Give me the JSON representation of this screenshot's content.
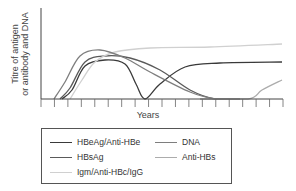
{
  "chart_data": {
    "type": "line",
    "title": "",
    "xlabel": "Years",
    "ylabel": "Titre of antigen or antibody and DNA",
    "x_ticks": 18,
    "grid": false,
    "legend_position": "bottom-box",
    "series": [
      {
        "name": "HBeAg/Anti-HBe",
        "color": "#3a3a3a",
        "points": [
          [
            62,
            99
          ],
          [
            72,
            90
          ],
          [
            85,
            66
          ],
          [
            105,
            60
          ],
          [
            125,
            64
          ],
          [
            136,
            84
          ],
          [
            145,
            99
          ],
          [
            160,
            84
          ],
          [
            185,
            67
          ],
          [
            220,
            63
          ],
          [
            282,
            62
          ]
        ]
      },
      {
        "name": "HBsAg",
        "color": "#5a5a5a",
        "points": [
          [
            60,
            99
          ],
          [
            70,
            88
          ],
          [
            85,
            62
          ],
          [
            105,
            56
          ],
          [
            130,
            58
          ],
          [
            160,
            70
          ],
          [
            190,
            90
          ],
          [
            215,
            99
          ],
          [
            240,
            99
          ]
        ]
      },
      {
        "name": "Igm/Anti-HBc/IgG",
        "color": "#d0d0d0",
        "points": [
          [
            70,
            99
          ],
          [
            82,
            80
          ],
          [
            95,
            62
          ],
          [
            115,
            52
          ],
          [
            150,
            48
          ],
          [
            210,
            47
          ],
          [
            282,
            44
          ]
        ]
      },
      {
        "name": "DNA",
        "color": "#7e7e7e",
        "points": [
          [
            54,
            99
          ],
          [
            65,
            82
          ],
          [
            80,
            56
          ],
          [
            100,
            50
          ],
          [
            125,
            58
          ],
          [
            150,
            72
          ],
          [
            190,
            92
          ],
          [
            215,
            99
          ],
          [
            230,
            99
          ]
        ]
      },
      {
        "name": "Anti-HBs",
        "color": "#acacac",
        "points": [
          [
            200,
            99
          ],
          [
            248,
            99
          ],
          [
            262,
            90
          ],
          [
            282,
            80
          ]
        ]
      }
    ]
  },
  "axes": {
    "ylabel": "Titre of antigen\nor antibody and DNA",
    "xlabel": "Years"
  },
  "legend": {
    "items": [
      {
        "label": "HBeAg/Anti-HBe",
        "color": "#3a3a3a"
      },
      {
        "label": "DNA",
        "color": "#7e7e7e"
      },
      {
        "label": "HBsAg",
        "color": "#5a5a5a"
      },
      {
        "label": "Anti-HBs",
        "color": "#acacac"
      },
      {
        "label": "Igm/Anti-HBc/IgG",
        "color": "#d0d0d0"
      }
    ]
  }
}
